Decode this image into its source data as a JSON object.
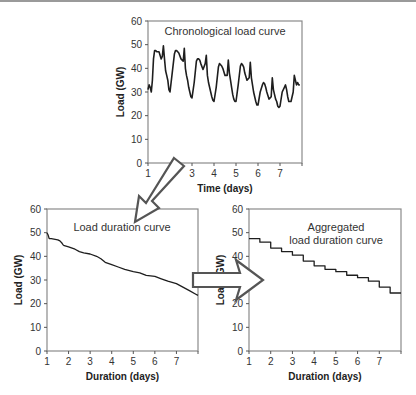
{
  "chart_data": [
    {
      "type": "line",
      "title": "Chronological load curve",
      "xlabel": "Time (days)",
      "ylabel": "Load (GW)",
      "xlim": [
        1,
        8
      ],
      "ylim": [
        0,
        60
      ],
      "xticks": [
        "1",
        "2",
        "3",
        "4",
        "5",
        "6",
        "7"
      ],
      "yticks": [
        "0",
        "10",
        "20",
        "30",
        "40",
        "50",
        "60"
      ],
      "grid": false,
      "x": [
        1.0,
        1.05,
        1.1,
        1.15,
        1.2,
        1.25,
        1.3,
        1.35,
        1.4,
        1.5,
        1.6,
        1.65,
        1.7,
        1.75,
        1.8,
        1.85,
        1.9,
        1.95,
        2.0,
        2.1,
        2.2,
        2.25,
        2.3,
        2.35,
        2.4,
        2.5,
        2.6,
        2.65,
        2.7,
        2.75,
        2.8,
        2.85,
        2.9,
        2.95,
        3.0,
        3.1,
        3.2,
        3.25,
        3.3,
        3.35,
        3.4,
        3.5,
        3.6,
        3.65,
        3.7,
        3.75,
        3.8,
        3.85,
        3.9,
        3.95,
        4.0,
        4.1,
        4.2,
        4.25,
        4.3,
        4.35,
        4.4,
        4.5,
        4.6,
        4.65,
        4.7,
        4.75,
        4.8,
        4.85,
        4.9,
        4.95,
        5.0,
        5.1,
        5.2,
        5.25,
        5.3,
        5.35,
        5.4,
        5.5,
        5.6,
        5.65,
        5.7,
        5.75,
        5.8,
        5.85,
        5.9,
        5.95,
        6.0,
        6.1,
        6.2,
        6.25,
        6.3,
        6.35,
        6.4,
        6.5,
        6.6,
        6.65,
        6.7,
        6.75,
        6.8,
        6.85,
        6.9,
        6.95,
        7.0,
        7.1,
        7.2,
        7.25,
        7.3,
        7.35,
        7.4,
        7.5,
        7.6,
        7.65,
        7.7,
        7.75,
        7.8,
        7.85,
        7.9,
        7.95,
        8.0
      ],
      "values": [
        31,
        33,
        32,
        30,
        35,
        44,
        47.5,
        47.5,
        47,
        47,
        44,
        45,
        49.5,
        44,
        39,
        37,
        35,
        31,
        30,
        38,
        46,
        47.5,
        47.5,
        47,
        46.5,
        44,
        43,
        48.5,
        40,
        37,
        35,
        32,
        30,
        28,
        27.5,
        34,
        43,
        44,
        44,
        43.5,
        42,
        39.5,
        42,
        45.5,
        37,
        34,
        32,
        30,
        28,
        26.5,
        26,
        32,
        40.5,
        42,
        41.5,
        41,
        40,
        37,
        37,
        43.5,
        38,
        35,
        32,
        29,
        27,
        26,
        26,
        33,
        41,
        42,
        41.5,
        40.5,
        38,
        35,
        36,
        42.5,
        36,
        33,
        30,
        28,
        26,
        24.5,
        24.5,
        30,
        33,
        34,
        33.5,
        32,
        30,
        27,
        28,
        36,
        31,
        29,
        27,
        26,
        24,
        23.5,
        24,
        30,
        32,
        33,
        31,
        28,
        26,
        26,
        30,
        37,
        35,
        33,
        34,
        33,
        33
      ]
    },
    {
      "type": "line",
      "title": "Load duration curve",
      "xlabel": "Duration (days)",
      "ylabel": "Load (GW)",
      "xlim": [
        1,
        8
      ],
      "ylim": [
        0,
        60
      ],
      "xticks": [
        "1",
        "2",
        "3",
        "4",
        "5",
        "6",
        "7"
      ],
      "yticks": [
        "0",
        "10",
        "20",
        "30",
        "40",
        "50",
        "60"
      ],
      "grid": false,
      "x": [
        1.0,
        1.05,
        1.1,
        1.2,
        1.5,
        1.6,
        1.7,
        1.75,
        1.8,
        2.0,
        2.3,
        2.5,
        2.7,
        3.0,
        3.3,
        3.5,
        3.7,
        4.0,
        4.3,
        4.6,
        5.0,
        5.3,
        5.6,
        6.0,
        6.3,
        6.6,
        7.0,
        7.3,
        7.6,
        7.9,
        8.0
      ],
      "values": [
        50,
        49,
        47.5,
        47.5,
        47,
        46.5,
        45.5,
        44.8,
        44.5,
        44,
        43,
        42,
        41.5,
        41,
        40,
        39,
        37.5,
        36.5,
        35.5,
        34.5,
        33.5,
        33,
        32,
        31.5,
        30.5,
        29.5,
        28.5,
        27,
        25.5,
        24,
        23.5
      ]
    },
    {
      "type": "line",
      "title": "Aggregated load duration curve",
      "title_lines": [
        "Aggregated",
        "load duration curve"
      ],
      "xlabel": "Duration (days)",
      "ylabel": "Load (GW)",
      "xlim": [
        1,
        8
      ],
      "ylim": [
        0,
        60
      ],
      "xticks": [
        "1",
        "2",
        "3",
        "4",
        "5",
        "6",
        "7"
      ],
      "yticks": [
        "0",
        "10",
        "20",
        "30",
        "40",
        "50",
        "60"
      ],
      "grid": false,
      "step": true,
      "x": [
        1.0,
        1.5,
        2.0,
        2.5,
        3.0,
        3.5,
        4.0,
        4.5,
        5.0,
        5.5,
        6.0,
        6.5,
        7.0,
        7.5,
        8.0
      ],
      "values": [
        47.5,
        46,
        43.5,
        42,
        40.5,
        38,
        36,
        34.5,
        33.5,
        32,
        31,
        29.5,
        27,
        24.5,
        24.5
      ]
    }
  ],
  "arrows": [
    {
      "from": "Chronological load curve",
      "to": "Load duration curve",
      "direction": "down-left"
    },
    {
      "from": "Load duration curve",
      "to": "Aggregated load duration curve",
      "direction": "right"
    }
  ]
}
